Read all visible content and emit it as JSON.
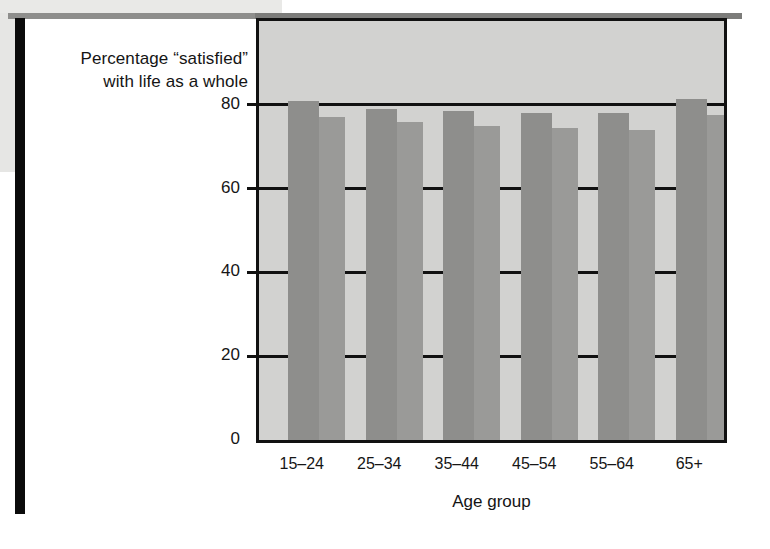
{
  "figure": {
    "title_line1": "Percentage “satisfied”",
    "title_line2": "with life as a whole",
    "xaxis_title": "Age group"
  },
  "chart_data": {
    "type": "bar",
    "title": "Percentage “satisfied” with life as a whole",
    "xlabel": "Age group",
    "ylabel": "Percentage “satisfied” with life as a whole",
    "categories": [
      "15–24",
      "25–34",
      "35–44",
      "45–54",
      "55–64",
      "65+"
    ],
    "yticks": [
      0,
      20,
      40,
      60,
      80
    ],
    "ylim": [
      0,
      100
    ],
    "grid": true,
    "legend": "none",
    "series": [
      {
        "name": "Series 1",
        "color": "#8e8e8c",
        "values": [
          81,
          79,
          78.5,
          78,
          78,
          81.5
        ]
      },
      {
        "name": "Series 2",
        "color": "#9a9a98",
        "values": [
          77,
          76,
          75,
          74.5,
          74,
          77.5
        ]
      }
    ]
  }
}
